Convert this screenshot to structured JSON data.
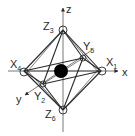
{
  "diagram": {
    "axes": {
      "x": {
        "label": "x"
      },
      "y": {
        "label": "y"
      },
      "z": {
        "label": "z"
      }
    },
    "vertices": [
      {
        "id": "X1",
        "letter": "X",
        "index": "1"
      },
      {
        "id": "Y2",
        "letter": "Y",
        "index": "2"
      },
      {
        "id": "Z3",
        "letter": "Z",
        "index": "3"
      },
      {
        "id": "X4",
        "letter": "X",
        "index": "4"
      },
      {
        "id": "Y5",
        "letter": "Y",
        "index": "5"
      },
      {
        "id": "Z6",
        "letter": "Z",
        "index": "6"
      }
    ],
    "center": {
      "name": "central-atom",
      "color": "#000000"
    },
    "colors": {
      "line": "#2a2a2a",
      "background": "#ffffff"
    }
  }
}
